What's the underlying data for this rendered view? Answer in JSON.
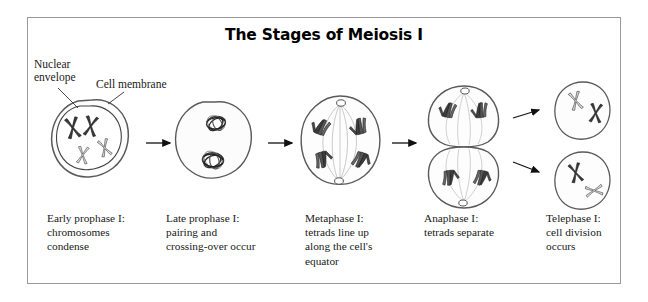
{
  "figure": {
    "title": "The Stages of Meiosis I",
    "border_color": "#9a9a9a",
    "background": "#ffffff",
    "ink_color": "#1a1a1a"
  },
  "annotations": [
    {
      "id": "nuclear-envelope",
      "line1": "Nuclear",
      "line2": "envelope",
      "points_to": "inner nuclear boundary of cell 1"
    },
    {
      "id": "cell-membrane",
      "line1": "Cell membrane",
      "line2": "",
      "points_to": "outer membrane of cell 1"
    }
  ],
  "stages": [
    {
      "key": "early-prophase-1",
      "caption_lines": [
        "Early prophase I:",
        "chromosomes",
        "condense"
      ],
      "structures": [
        "cell membrane",
        "nuclear envelope",
        "4 condensed chromosomes"
      ]
    },
    {
      "key": "late-prophase-1",
      "caption_lines": [
        "Late prophase I:",
        "pairing and",
        "crossing-over occur"
      ],
      "structures": [
        "cell membrane",
        "2 tetrads with crossing-over"
      ]
    },
    {
      "key": "metaphase-1",
      "caption_lines": [
        "Metaphase I:",
        "tetrads line up",
        "along the cell's",
        "equator"
      ],
      "structures": [
        "cell membrane",
        "2 centrioles",
        "spindle fibers",
        "4 tetrad groups at equator"
      ]
    },
    {
      "key": "anaphase-1",
      "caption_lines": [
        "Anaphase I:",
        "tetrads separate"
      ],
      "structures": [
        "pinching cell",
        "2 centrioles",
        "spindle fibers",
        "2 tetrad groups per pole"
      ]
    },
    {
      "key": "telophase-1",
      "caption_lines": [
        "Telephase I:",
        "cell division",
        "occurs"
      ],
      "structures": [
        "2 daughter cells",
        "2 chromosomes each"
      ]
    }
  ],
  "arrows": [
    {
      "id": "arrow-1",
      "from": "early-prophase-1",
      "to": "late-prophase-1",
      "direction": "right"
    },
    {
      "id": "arrow-2",
      "from": "late-prophase-1",
      "to": "metaphase-1",
      "direction": "right"
    },
    {
      "id": "arrow-3",
      "from": "metaphase-1",
      "to": "anaphase-1",
      "direction": "right"
    },
    {
      "id": "arrow-4",
      "from": "anaphase-1",
      "to": "telophase-1-upper",
      "direction": "up-right"
    },
    {
      "id": "arrow-5",
      "from": "anaphase-1",
      "to": "telophase-1-lower",
      "direction": "down-right"
    }
  ]
}
